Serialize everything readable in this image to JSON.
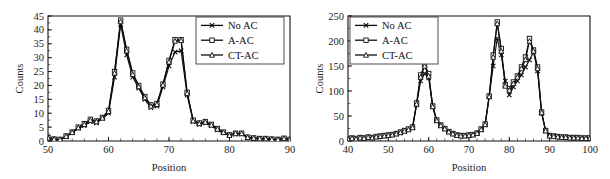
{
  "figure": {
    "panels": [
      "left",
      "right"
    ],
    "background": "#ffffff",
    "ink_color": "#0d0d0d"
  },
  "chart_data": [
    {
      "panel": "left",
      "type": "line",
      "title": "",
      "xlabel": "Position",
      "ylabel": "Counts",
      "xlim": [
        50,
        90
      ],
      "ylim": [
        0,
        45
      ],
      "xticks": [
        50,
        60,
        70,
        80,
        90
      ],
      "yticks": [
        0,
        5,
        10,
        15,
        20,
        25,
        30,
        35,
        40,
        45
      ],
      "xtick_labels": [
        "50",
        "60",
        "70",
        "80",
        "90"
      ],
      "ytick_labels": [
        "0",
        "5",
        "10",
        "15",
        "20",
        "25",
        "30",
        "35",
        "40",
        "45"
      ],
      "minor_xtick_step": 2,
      "grid": false,
      "legend_position": "top-right",
      "x": [
        50,
        51,
        52,
        53,
        54,
        55,
        56,
        57,
        58,
        59,
        60,
        61,
        62,
        63,
        64,
        65,
        66,
        67,
        68,
        69,
        70,
        71,
        72,
        73,
        74,
        75,
        76,
        77,
        78,
        79,
        80,
        81,
        82,
        83,
        84,
        85,
        86,
        87,
        88,
        89,
        90
      ],
      "series": [
        {
          "name": "No AC",
          "marker": "x",
          "values": [
            1.0,
            0.6,
            0.5,
            1.5,
            3.0,
            4.5,
            5.5,
            7.0,
            6.5,
            8.0,
            10.0,
            23.0,
            42.0,
            31.0,
            23.0,
            19.0,
            15.0,
            12.0,
            12.5,
            19.5,
            27.0,
            32.0,
            32.5,
            16.5,
            7.0,
            6.0,
            6.5,
            5.5,
            4.0,
            3.0,
            2.0,
            2.5,
            2.5,
            1.2,
            1.0,
            0.8,
            0.8,
            0.6,
            0.5,
            0.8,
            0.5
          ]
        },
        {
          "name": "A-AC",
          "marker": "square",
          "values": [
            1.2,
            0.7,
            0.6,
            1.8,
            3.2,
            5.0,
            6.2,
            7.8,
            7.2,
            8.5,
            11.0,
            25.0,
            43.5,
            33.0,
            24.5,
            20.0,
            16.0,
            13.0,
            13.5,
            20.5,
            29.0,
            36.5,
            36.5,
            17.5,
            7.5,
            6.5,
            7.0,
            6.0,
            4.5,
            3.2,
            2.2,
            2.8,
            2.8,
            1.4,
            1.1,
            0.9,
            0.9,
            0.7,
            0.6,
            1.0,
            0.6
          ]
        },
        {
          "name": "CT-AC",
          "marker": "triangle",
          "values": [
            1.1,
            0.7,
            0.55,
            1.7,
            3.1,
            4.8,
            6.0,
            7.5,
            7.0,
            8.3,
            10.7,
            24.5,
            43.0,
            32.5,
            24.0,
            19.6,
            15.6,
            12.6,
            13.2,
            20.2,
            28.5,
            36.0,
            36.2,
            17.2,
            7.3,
            6.3,
            6.8,
            5.8,
            4.3,
            3.1,
            2.1,
            2.7,
            2.7,
            1.3,
            1.05,
            0.85,
            0.85,
            0.65,
            0.55,
            0.9,
            0.55
          ]
        }
      ],
      "legend": [
        {
          "label": "No AC",
          "marker": "x"
        },
        {
          "label": "A-AC",
          "marker": "square"
        },
        {
          "label": "CT-AC",
          "marker": "triangle"
        }
      ]
    },
    {
      "panel": "right",
      "type": "line",
      "title": "",
      "xlabel": "Position",
      "ylabel": "Counts",
      "xlim": [
        40,
        100
      ],
      "ylim": [
        0,
        250
      ],
      "xticks": [
        40,
        50,
        60,
        70,
        80,
        90,
        100
      ],
      "yticks": [
        0,
        50,
        100,
        150,
        200,
        250
      ],
      "xtick_labels": [
        "40",
        "50",
        "60",
        "70",
        "80",
        "90",
        "100"
      ],
      "ytick_labels": [
        "0",
        "50",
        "100",
        "150",
        "200",
        "250"
      ],
      "minor_xtick_step": 2,
      "grid": false,
      "legend_position": "top-left",
      "x": [
        40,
        41,
        42,
        43,
        44,
        45,
        46,
        47,
        48,
        49,
        50,
        51,
        52,
        53,
        54,
        55,
        56,
        57,
        58,
        59,
        60,
        61,
        62,
        63,
        64,
        65,
        66,
        67,
        68,
        69,
        70,
        71,
        72,
        73,
        74,
        75,
        76,
        77,
        78,
        79,
        80,
        81,
        82,
        83,
        84,
        85,
        86,
        87,
        88,
        89,
        90,
        91,
        92,
        93,
        94,
        95,
        96,
        97,
        98,
        99,
        100
      ],
      "series": [
        {
          "name": "No AC",
          "marker": "x",
          "values": [
            4,
            5,
            4,
            6,
            5,
            7,
            6,
            8,
            9,
            10,
            11,
            12,
            14,
            16,
            19,
            22,
            26,
            72,
            120,
            135,
            126,
            68,
            40,
            30,
            24,
            18,
            14,
            11,
            10,
            10,
            11,
            12,
            15,
            22,
            32,
            88,
            150,
            205,
            172,
            120,
            92,
            108,
            120,
            132,
            148,
            162,
            178,
            140,
            55,
            20,
            10,
            9,
            8,
            7,
            7,
            6,
            6,
            6,
            5,
            5,
            5
          ]
        },
        {
          "name": "A-AC",
          "marker": "square",
          "values": [
            5,
            6,
            5,
            7,
            6,
            8,
            7,
            9,
            10,
            11,
            12,
            13,
            15,
            18,
            21,
            24,
            28,
            76,
            132,
            152,
            135,
            70,
            42,
            32,
            25,
            19,
            15,
            12,
            11,
            11,
            12,
            13,
            16,
            24,
            34,
            90,
            172,
            238,
            185,
            112,
            105,
            118,
            130,
            148,
            168,
            205,
            182,
            148,
            58,
            21,
            11,
            10,
            9,
            8,
            8,
            7,
            7,
            7,
            6,
            6,
            6
          ]
        },
        {
          "name": "CT-AC",
          "marker": "triangle",
          "values": [
            4.5,
            5.5,
            4.5,
            6.5,
            5.5,
            7.5,
            6.5,
            8.5,
            9.5,
            10.5,
            11.5,
            12.5,
            14.5,
            17,
            20,
            23,
            27,
            74,
            128,
            150,
            130,
            69,
            41,
            31,
            24.5,
            18.5,
            14.5,
            11.5,
            10.5,
            10.5,
            11.5,
            12.5,
            15.5,
            23,
            33,
            89,
            168,
            235,
            180,
            110,
            102,
            115,
            128,
            145,
            163,
            200,
            180,
            145,
            57,
            20.5,
            10.5,
            9.5,
            8.5,
            7.5,
            7.5,
            6.5,
            6.5,
            6.5,
            5.5,
            5.5,
            5.5
          ]
        }
      ],
      "legend": [
        {
          "label": "No AC",
          "marker": "x"
        },
        {
          "label": "A-AC",
          "marker": "square"
        },
        {
          "label": "CT-AC",
          "marker": "triangle"
        }
      ]
    }
  ]
}
